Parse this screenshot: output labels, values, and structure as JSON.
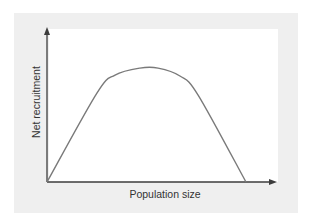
{
  "chart_data": {
    "type": "line",
    "title": "",
    "xlabel": "Population size",
    "ylabel": "Net recruitment",
    "xlim": [
      0,
      1
    ],
    "ylim": [
      0,
      1
    ],
    "grid": false,
    "ticks": false,
    "legend": null,
    "series": [
      {
        "name": "Net recruitment curve",
        "color": "#7a7a7a",
        "x": [
          0,
          0.217,
          0.296,
          0.404,
          0.483,
          0.578,
          0.657,
          0.865
        ],
        "y": [
          0,
          0.574,
          0.69,
          0.735,
          0.735,
          0.684,
          0.561,
          0
        ]
      }
    ],
    "colors": {
      "axis": "#3c3c3c",
      "panel_background": "#efefef",
      "plot_background": "#ffffff"
    }
  }
}
